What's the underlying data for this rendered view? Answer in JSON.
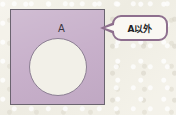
{
  "figure": {
    "type": "venn-complement-diagram",
    "description_labels": {
      "universe_label": "A",
      "callout_label": "A以外"
    }
  },
  "canvas": {
    "background_color": "#f4f2ea",
    "width": 176,
    "height": 115
  },
  "universe": {
    "name": "universal-set-square",
    "fill_color": "#c6aec9",
    "border_color": "#6b6470"
  },
  "set_a": {
    "label": "A",
    "fill_color": "#f2f0e8",
    "border_color": "#8c7f93"
  },
  "callout": {
    "label": "A以外",
    "fill_color": "#faf8f3",
    "border_color": "#8e6f8e",
    "text_color": "#231f26"
  }
}
